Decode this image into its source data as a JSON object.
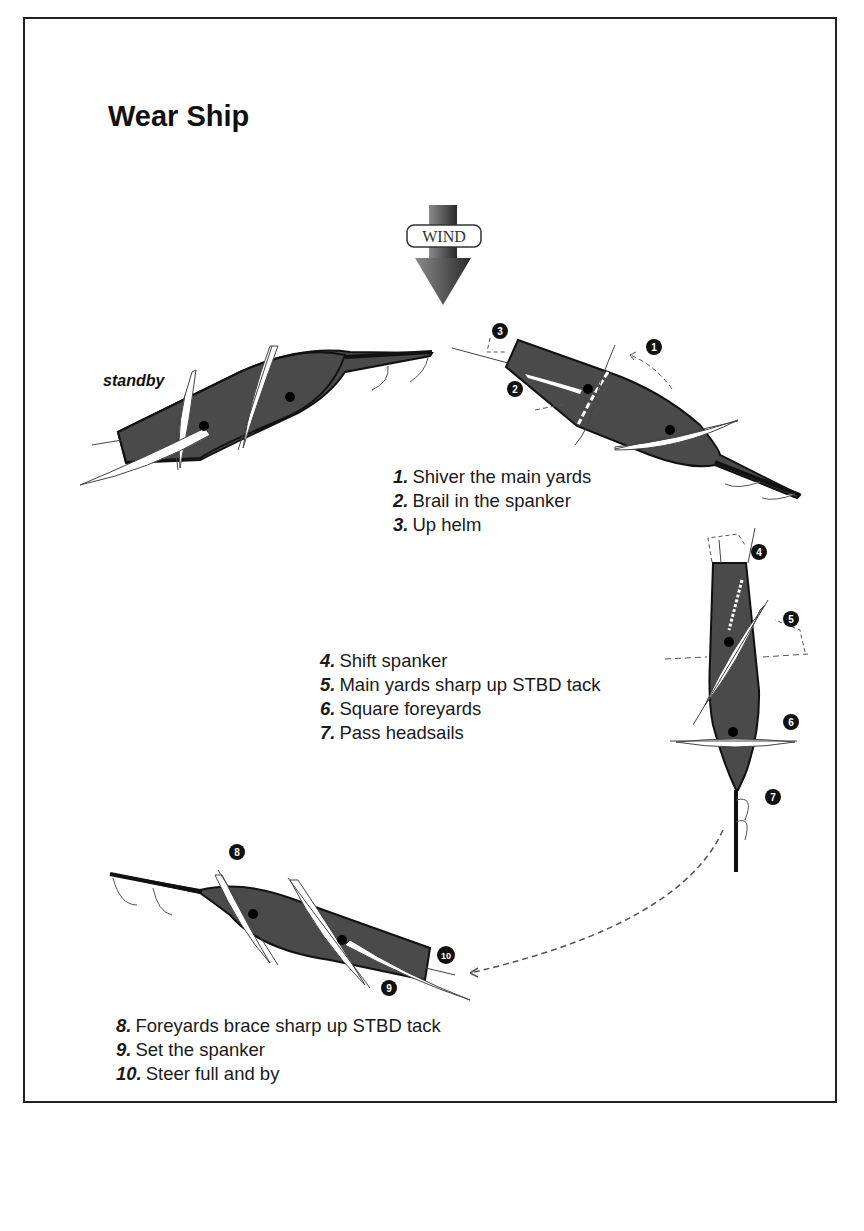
{
  "title": "Wear Ship",
  "wind_label": "WIND",
  "stage_label": "standby",
  "groups": [
    {
      "steps": [
        {
          "num": "1.",
          "text": "Shiver the main yards"
        },
        {
          "num": "2.",
          "text": "Brail in the spanker"
        },
        {
          "num": "3.",
          "text": "Up helm"
        }
      ]
    },
    {
      "steps": [
        {
          "num": "4.",
          "text": "Shift spanker"
        },
        {
          "num": "5.",
          "text": "Main yards sharp up STBD tack"
        },
        {
          "num": "6.",
          "text": "Square foreyards"
        },
        {
          "num": "7.",
          "text": "Pass headsails"
        }
      ]
    },
    {
      "steps": [
        {
          "num": "8.",
          "text": "Foreyards brace sharp up STBD tack"
        },
        {
          "num": "9.",
          "text": "Set the spanker"
        },
        {
          "num": "10.",
          "text": "Steer full and by"
        }
      ]
    }
  ],
  "markers": [
    "1",
    "2",
    "3",
    "4",
    "5",
    "6",
    "7",
    "8",
    "9",
    "10"
  ],
  "colors": {
    "hull": "#4a4a4a",
    "outline": "#111111",
    "sail": "#ffffff",
    "arrow": "#5a5a5a"
  }
}
